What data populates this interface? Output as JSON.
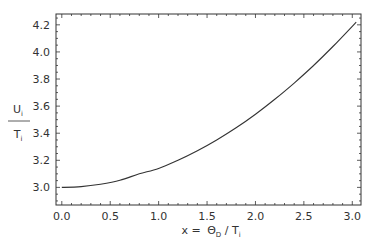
{
  "chart_data": {
    "type": "line",
    "title": "",
    "xlabel": "x = ΘD / Ti",
    "xlabel_parts": {
      "prefix": "x = ",
      "theta": "Θ",
      "theta_sub": "D",
      "slash": " / T",
      "t_sub": "i"
    },
    "ylabel": "Ui / Ti",
    "ylabel_parts": {
      "num": "U",
      "num_sub": "i",
      "den": "T",
      "den_sub": "i"
    },
    "xlim": [
      -0.06,
      3.09
    ],
    "ylim": [
      2.87,
      4.28
    ],
    "xticks": [
      0.0,
      0.5,
      1.0,
      1.5,
      2.0,
      2.5,
      3.0
    ],
    "xtick_labels": [
      "0.0",
      "0.5",
      "1.0",
      "1.5",
      "2.0",
      "2.5",
      "3.0"
    ],
    "yticks": [
      3.0,
      3.2,
      3.4,
      3.6,
      3.8,
      4.0,
      4.2
    ],
    "ytick_labels": [
      "3.0",
      "3.2",
      "3.4",
      "3.6",
      "3.8",
      "4.0",
      "4.2"
    ],
    "grid": false,
    "legend": null,
    "series": [
      {
        "name": "Ui/Ti",
        "color": "#333333",
        "x": [
          0.0,
          0.2,
          0.4,
          0.6,
          0.8,
          1.0,
          1.2,
          1.4,
          1.6,
          1.8,
          2.0,
          2.2,
          2.4,
          2.6,
          2.8,
          3.04
        ],
        "y": [
          3.0,
          3.006,
          3.023,
          3.052,
          3.1,
          3.14,
          3.2,
          3.27,
          3.35,
          3.44,
          3.54,
          3.65,
          3.77,
          3.9,
          4.04,
          4.22
        ]
      }
    ]
  }
}
